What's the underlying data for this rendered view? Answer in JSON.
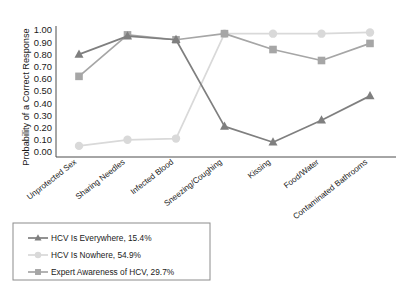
{
  "chart_data": {
    "type": "line",
    "title": "",
    "xlabel": "",
    "ylabel": "Probability of a Correct Response",
    "ylim": [
      0.0,
      1.0
    ],
    "grid": false,
    "legend_position": "below-left",
    "categories": [
      "Unprotected Sex",
      "Sharing Needles",
      "Infected Blood",
      "Sneezing/Coughing",
      "Kissing",
      "Food/Water",
      "Contaminated Bathrooms"
    ],
    "ytick_labels": [
      "1.00",
      "0.90",
      "0.80",
      "0.70",
      "0.60",
      "0.50",
      "0.40",
      "0.30",
      "0.20",
      "0.10",
      "0.00"
    ],
    "ytick_values": [
      1.0,
      0.9,
      0.8,
      0.7,
      0.6,
      0.5,
      0.4,
      0.3,
      0.2,
      0.1,
      0.0
    ],
    "series": [
      {
        "name": "HCV Is Everywhere, 15.4%",
        "marker": "triangle",
        "color": "#7f7f7f",
        "values": [
          0.8,
          0.95,
          0.92,
          0.21,
          0.08,
          0.26,
          0.46
        ]
      },
      {
        "name": "HCV Is Nowhere, 54.9%",
        "marker": "circle",
        "color": "#d9d9d9",
        "values": [
          0.05,
          0.1,
          0.11,
          0.97,
          0.97,
          0.97,
          0.98
        ]
      },
      {
        "name": "Expert Awareness of HCV, 29.7%",
        "marker": "square",
        "color": "#a6a6a6",
        "values": [
          0.62,
          0.96,
          0.92,
          0.97,
          0.84,
          0.75,
          0.89
        ]
      }
    ]
  },
  "legend": {
    "entries": [
      {
        "label": "HCV Is Everywhere, 15.4%"
      },
      {
        "label": "HCV Is Nowhere, 54.9%"
      },
      {
        "label": "Expert Awareness of HCV, 29.7%"
      }
    ]
  },
  "axes": {
    "y_axis_title": "Probability of a Correct Response"
  }
}
